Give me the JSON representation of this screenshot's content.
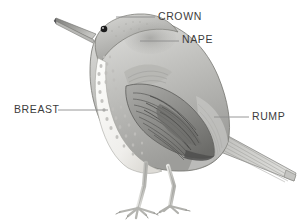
{
  "figure": {
    "type": "bird-anatomy-diagram",
    "background_color": "#ffffff",
    "illustration_style": "pencil-shaded grayscale engraving"
  },
  "labels": [
    {
      "id": "crown",
      "text": "CROWN",
      "text_x": 158,
      "text_y": 11,
      "leader": {
        "x1": 116,
        "y1": 17,
        "x2": 155,
        "y2": 17
      },
      "anchor_part": "top of head"
    },
    {
      "id": "nape",
      "text": "NAPE",
      "text_x": 182,
      "text_y": 34,
      "leader": {
        "x1": 140,
        "y1": 41,
        "x2": 179,
        "y2": 41
      },
      "anchor_part": "back of neck"
    },
    {
      "id": "breast",
      "text": "BREAST",
      "text_x": 14,
      "text_y": 104,
      "leader": {
        "x1": 58,
        "y1": 110,
        "x2": 108,
        "y2": 110
      },
      "anchor_part": "spotted underside"
    },
    {
      "id": "rump",
      "text": "RUMP",
      "text_x": 252,
      "text_y": 111,
      "leader": {
        "x1": 214,
        "y1": 117,
        "x2": 249,
        "y2": 117
      },
      "anchor_part": "lower back above tail"
    }
  ],
  "colors": {
    "label_text": "#3c3c3c",
    "leader_line": "#8d8d8d",
    "outline": "#6f6f6f",
    "body_light": "#dcdcda",
    "body_mid": "#b4b4b2",
    "body_dark": "#8a8a88",
    "wing_dark": "#6a6a68",
    "breast_pale": "#f2f1ee",
    "spot": "#b9b8b4",
    "eye": "#1c1c1c",
    "leg": "#cfcfcb"
  },
  "anatomy_parts": [
    "beak",
    "eye",
    "crown",
    "nape",
    "throat",
    "breast",
    "belly",
    "wing coverts",
    "primaries",
    "rump",
    "tail",
    "legs",
    "feet"
  ]
}
